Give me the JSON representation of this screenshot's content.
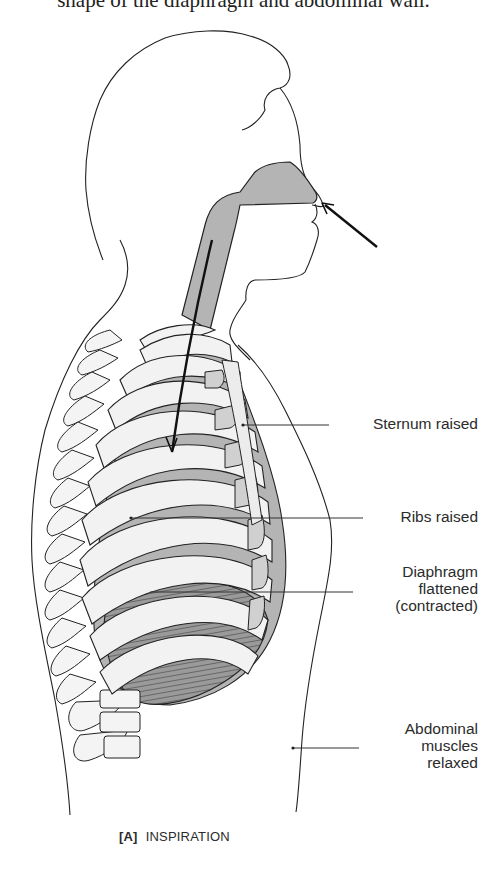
{
  "header": {
    "cutoff_text": "shape of the diaphragm and abdominal wall."
  },
  "figure": {
    "panel_letter": "[A]",
    "caption": "INSPIRATION",
    "colors": {
      "lung_fill": "#b4b4b4",
      "rib_fill": "#f2f2f2",
      "diaphragm_fill": "#8f8f8f",
      "line": "#222222"
    },
    "arrows": [
      {
        "name": "air-in-nose-arrow",
        "direction": "toward nose"
      },
      {
        "name": "air-down-trachea-arrow",
        "direction": "down into lungs"
      }
    ],
    "labels": [
      {
        "id": "sternum",
        "lines": [
          "Sternum raised"
        ]
      },
      {
        "id": "ribs",
        "lines": [
          "Ribs raised"
        ]
      },
      {
        "id": "diaphragm",
        "lines": [
          "Diaphragm",
          "flattened",
          "(contracted)"
        ]
      },
      {
        "id": "abdominal",
        "lines": [
          "Abdominal",
          "muscles",
          "relaxed"
        ]
      }
    ]
  }
}
